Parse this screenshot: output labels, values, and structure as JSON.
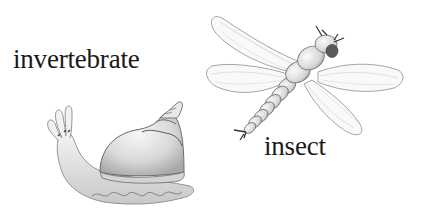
{
  "labels": {
    "invertebrate": "invertebrate",
    "insect": "insect"
  },
  "illustrations": [
    {
      "subject": "snail",
      "caption": "invertebrate"
    },
    {
      "subject": "dragonfly",
      "caption": "insect"
    }
  ],
  "colors": {
    "background": "#ffffff",
    "text": "#1a1a1a",
    "sketch_line": "#8a8a8a",
    "sketch_dark": "#4a4a4a",
    "sketch_fill": "#efefef"
  }
}
